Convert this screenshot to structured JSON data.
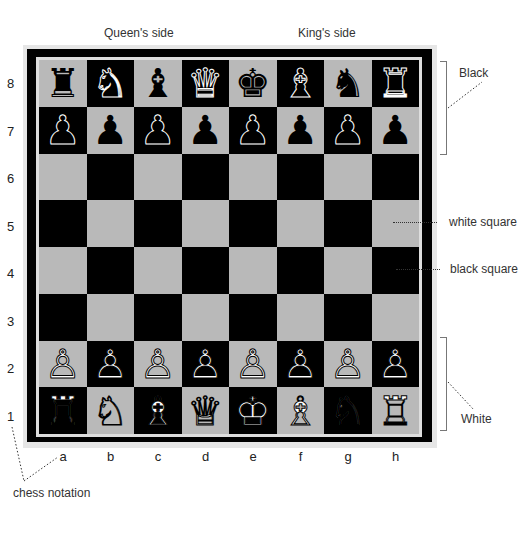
{
  "header": {
    "queens_side": "Queen's side",
    "kings_side": "King's side"
  },
  "ranks": [
    "8",
    "7",
    "6",
    "5",
    "4",
    "3",
    "2",
    "1"
  ],
  "files": [
    "a",
    "b",
    "c",
    "d",
    "e",
    "f",
    "g",
    "h"
  ],
  "annotations": {
    "black": "Black",
    "white": "White",
    "white_square": "white square",
    "black_square": "black square",
    "chess_notation": "chess notation"
  },
  "colors": {
    "light_square": "#b9b9b9",
    "dark_square": "#000000",
    "frame": "#e6e6e6"
  },
  "board": [
    [
      "♜",
      "♞",
      "♝",
      "♛",
      "♚",
      "♝",
      "♞",
      "♜"
    ],
    [
      "♟",
      "♟",
      "♟",
      "♟",
      "♟",
      "♟",
      "♟",
      "♟"
    ],
    [
      "",
      "",
      "",
      "",
      "",
      "",
      "",
      ""
    ],
    [
      "",
      "",
      "",
      "",
      "",
      "",
      "",
      ""
    ],
    [
      "",
      "",
      "",
      "",
      "",
      "",
      "",
      ""
    ],
    [
      "",
      "",
      "",
      "",
      "",
      "",
      "",
      ""
    ],
    [
      "♙",
      "♙",
      "♙",
      "♙",
      "♙",
      "♙",
      "♙",
      "♙"
    ],
    [
      "♖",
      "♘",
      "♗",
      "♕",
      "♔",
      "♗",
      "♘",
      "♖"
    ]
  ],
  "piece_colors": [
    [
      "b",
      "b",
      "b",
      "b",
      "b",
      "b",
      "b",
      "b"
    ],
    [
      "b",
      "b",
      "b",
      "b",
      "b",
      "b",
      "b",
      "b"
    ],
    [
      "",
      "",
      "",
      "",
      "",
      "",
      "",
      ""
    ],
    [
      "",
      "",
      "",
      "",
      "",
      "",
      "",
      ""
    ],
    [
      "",
      "",
      "",
      "",
      "",
      "",
      "",
      ""
    ],
    [
      "",
      "",
      "",
      "",
      "",
      "",
      "",
      ""
    ],
    [
      "w",
      "w",
      "w",
      "w",
      "w",
      "w",
      "w",
      "w"
    ],
    [
      "w",
      "w",
      "w",
      "w",
      "w",
      "w",
      "w",
      "w"
    ]
  ]
}
